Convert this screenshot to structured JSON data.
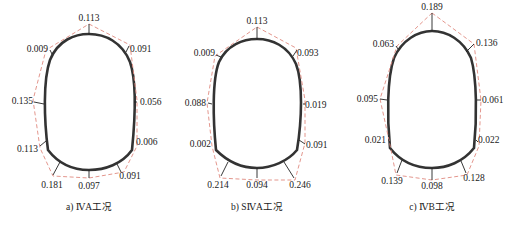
{
  "figure": {
    "colors": {
      "lining": "#333333",
      "envelope": "#e08a80",
      "text": "#1a1a1a"
    },
    "panels": [
      {
        "id": "a",
        "caption": "a) ⅣA工况",
        "values": {
          "crown": "0.113",
          "left_shoulder": "0.009",
          "right_shoulder": "0.091",
          "left_wall": "0.135",
          "right_wall": "0.056",
          "left_foot": "0.113",
          "right_foot": "0.006",
          "left_invert": "0.181",
          "invert": "0.097",
          "right_invert": "0.091"
        }
      },
      {
        "id": "b",
        "caption": "b) SⅣA工况",
        "values": {
          "crown": "0.113",
          "left_shoulder": "0.009",
          "right_shoulder": "0.093",
          "left_wall": "0.088",
          "right_wall": "0.019",
          "left_foot": "0.002",
          "right_foot": "0.091",
          "left_invert": "0.214",
          "invert": "0.094",
          "right_invert": "0.246"
        }
      },
      {
        "id": "c",
        "caption": "c) ⅣB工况",
        "values": {
          "crown": "0.189",
          "left_shoulder": "0.063",
          "right_shoulder": "0.136",
          "left_wall": "0.095",
          "right_wall": "0.061",
          "left_foot": "0.021",
          "right_foot": "0.022",
          "left_invert": "0.139",
          "invert": "0.098",
          "right_invert": "0.128"
        }
      }
    ]
  }
}
